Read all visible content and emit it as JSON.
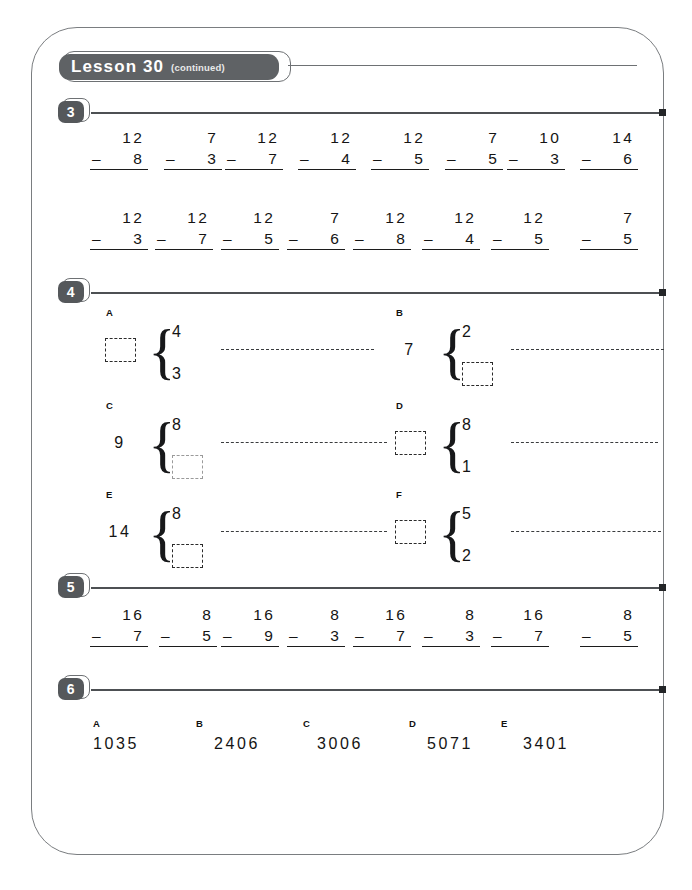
{
  "page": {
    "banner": {
      "title": "Lesson 30",
      "subtitle": "(continued)"
    }
  },
  "sections": [
    {
      "number": "3",
      "type": "subtraction-rows",
      "rows": [
        [
          {
            "top": "12",
            "op": "–",
            "bottom": "8"
          },
          {
            "top": "7",
            "op": "–",
            "bottom": "3"
          },
          {
            "top": "12",
            "op": "–",
            "bottom": "7"
          },
          {
            "top": "12",
            "op": "–",
            "bottom": "4"
          },
          {
            "top": "12",
            "op": "–",
            "bottom": "5"
          },
          {
            "top": "7",
            "op": "–",
            "bottom": "5"
          },
          {
            "top": "10",
            "op": "–",
            "bottom": "3"
          },
          {
            "top": "14",
            "op": "–",
            "bottom": "6"
          }
        ],
        [
          {
            "top": "12",
            "op": "–",
            "bottom": "3"
          },
          {
            "top": "12",
            "op": "–",
            "bottom": "7"
          },
          {
            "top": "12",
            "op": "–",
            "bottom": "5"
          },
          {
            "top": "7",
            "op": "–",
            "bottom": "6"
          },
          {
            "top": "12",
            "op": "–",
            "bottom": "8"
          },
          {
            "top": "12",
            "op": "–",
            "bottom": "4"
          },
          {
            "top": "12",
            "op": "–",
            "bottom": "5"
          },
          {
            "top": "7",
            "op": "–",
            "bottom": "5"
          }
        ]
      ]
    },
    {
      "number": "4",
      "type": "part-whole",
      "items": [
        {
          "letter": "A",
          "total": "",
          "total_is_box": true,
          "part_top": "4",
          "part_top_is_box": false,
          "part_bottom": "3",
          "part_bottom_is_box": false
        },
        {
          "letter": "B",
          "total": "7",
          "total_is_box": false,
          "part_top": "2",
          "part_top_is_box": false,
          "part_bottom": "",
          "part_bottom_is_box": true
        },
        {
          "letter": "C",
          "total": "9",
          "total_is_box": false,
          "part_top": "8",
          "part_top_is_box": false,
          "part_bottom": "",
          "part_bottom_is_box": true
        },
        {
          "letter": "D",
          "total": "",
          "total_is_box": true,
          "part_top": "8",
          "part_top_is_box": false,
          "part_bottom": "1",
          "part_bottom_is_box": false
        },
        {
          "letter": "E",
          "total": "14",
          "total_is_box": false,
          "part_top": "8",
          "part_top_is_box": false,
          "part_bottom": "",
          "part_bottom_is_box": true
        },
        {
          "letter": "F",
          "total": "",
          "total_is_box": true,
          "part_top": "5",
          "part_top_is_box": false,
          "part_bottom": "2",
          "part_bottom_is_box": false
        }
      ]
    },
    {
      "number": "5",
      "type": "subtraction-rows",
      "rows": [
        [
          {
            "top": "16",
            "op": "–",
            "bottom": "7"
          },
          {
            "top": "8",
            "op": "–",
            "bottom": "5"
          },
          {
            "top": "16",
            "op": "–",
            "bottom": "9"
          },
          {
            "top": "8",
            "op": "–",
            "bottom": "3"
          },
          {
            "top": "16",
            "op": "–",
            "bottom": "7"
          },
          {
            "top": "8",
            "op": "–",
            "bottom": "3"
          },
          {
            "top": "16",
            "op": "–",
            "bottom": "7"
          },
          {
            "top": "8",
            "op": "–",
            "bottom": "5"
          }
        ]
      ]
    },
    {
      "number": "6",
      "type": "number-list",
      "items": [
        {
          "letter": "A",
          "value": "1035"
        },
        {
          "letter": "B",
          "value": "2406"
        },
        {
          "letter": "C",
          "value": "3006"
        },
        {
          "letter": "D",
          "value": "5071"
        },
        {
          "letter": "E",
          "value": "3401"
        }
      ]
    }
  ]
}
